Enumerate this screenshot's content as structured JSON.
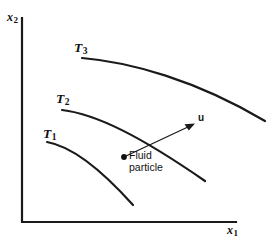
{
  "figure": {
    "background_color": "#ffffff",
    "line_color": "#1a1a1a"
  },
  "axes": {
    "x_axis_label": "x",
    "x_axis_subscript": "1",
    "y_axis_label": "x",
    "y_axis_subscript": "2",
    "origin": {
      "x": 22,
      "y": 222
    },
    "x_axis_end": {
      "x": 236,
      "y": 222
    },
    "y_axis_end": {
      "x": 22,
      "y": 18
    }
  },
  "isotherms": [
    {
      "id": "T1",
      "label": "T",
      "subscript": "1",
      "label_pos": {
        "x": 43,
        "y": 127
      },
      "path": "M 47 142 C 70 146 98 166 133 205"
    },
    {
      "id": "T2",
      "label": "T",
      "subscript": "2",
      "label_pos": {
        "x": 56,
        "y": 92
      },
      "path": "M 62 110 C 96 114 140 136 205 181"
    },
    {
      "id": "T3",
      "label": "T",
      "subscript": "3",
      "label_pos": {
        "x": 74,
        "y": 41
      },
      "path": "M 82 58 C 130 62 196 80 265 121"
    }
  ],
  "velocity_vector": {
    "label": "u",
    "label_pos": {
      "x": 198,
      "y": 113
    },
    "tail": {
      "x": 126,
      "y": 156
    },
    "tip": {
      "x": 194,
      "y": 124
    }
  },
  "fluid_particle": {
    "dot_pos": {
      "x": 124,
      "y": 157
    },
    "caption_line_1": "Fluid",
    "caption_line_2": "particle",
    "caption_pos": {
      "x": 129,
      "y": 150
    }
  }
}
